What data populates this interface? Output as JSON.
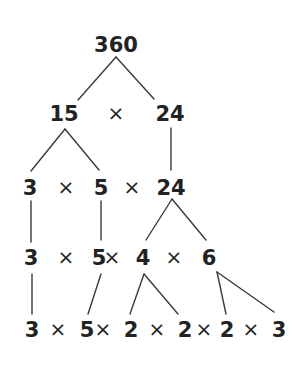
{
  "diagram": {
    "root": "360",
    "text_color": "#222222",
    "line_color": "#3a3a3a",
    "rows": [
      {
        "tokens": [
          {
            "text": "360",
            "type": "number",
            "x": 116,
            "y": 52
          }
        ]
      },
      {
        "tokens": [
          {
            "text": "15",
            "type": "number",
            "x": 64,
            "y": 121
          },
          {
            "text": "×",
            "type": "operator",
            "x": 116,
            "y": 120
          },
          {
            "text": "24",
            "type": "number",
            "x": 170,
            "y": 121
          }
        ]
      },
      {
        "tokens": [
          {
            "text": "3",
            "type": "number",
            "x": 30,
            "y": 195
          },
          {
            "text": "×",
            "type": "operator",
            "x": 66,
            "y": 194
          },
          {
            "text": "5",
            "type": "number",
            "x": 101,
            "y": 195
          },
          {
            "text": "×",
            "type": "operator",
            "x": 132,
            "y": 194
          },
          {
            "text": "24",
            "type": "number",
            "x": 171,
            "y": 195
          }
        ]
      },
      {
        "tokens": [
          {
            "text": "3",
            "type": "number",
            "x": 31,
            "y": 265
          },
          {
            "text": "×",
            "type": "operator",
            "x": 66,
            "y": 264
          },
          {
            "text": "5",
            "type": "number",
            "x": 99,
            "y": 265
          },
          {
            "text": "×",
            "type": "operator",
            "x": 112,
            "y": 264
          },
          {
            "text": "4",
            "type": "number",
            "x": 143,
            "y": 265
          },
          {
            "text": "×",
            "type": "operator",
            "x": 174,
            "y": 264
          },
          {
            "text": "6",
            "type": "number",
            "x": 209,
            "y": 265
          }
        ]
      },
      {
        "tokens": [
          {
            "text": "3",
            "type": "number",
            "x": 32,
            "y": 337
          },
          {
            "text": "×",
            "type": "operator",
            "x": 58,
            "y": 336
          },
          {
            "text": "5",
            "type": "number",
            "x": 87,
            "y": 337
          },
          {
            "text": "×",
            "type": "operator",
            "x": 103,
            "y": 336
          },
          {
            "text": "2",
            "type": "number",
            "x": 131,
            "y": 337
          },
          {
            "text": "×",
            "type": "operator",
            "x": 157,
            "y": 336
          },
          {
            "text": "2",
            "type": "number",
            "x": 185,
            "y": 337
          },
          {
            "text": "×",
            "type": "operator",
            "x": 204,
            "y": 336
          },
          {
            "text": "2",
            "type": "number",
            "x": 227,
            "y": 337
          },
          {
            "text": "×",
            "type": "operator",
            "x": 251,
            "y": 336
          },
          {
            "text": "3",
            "type": "number",
            "x": 279,
            "y": 337
          }
        ]
      }
    ],
    "edges": [
      {
        "from": "360",
        "to": "15",
        "x1": 116,
        "y1": 57,
        "x2": 78,
        "y2": 100
      },
      {
        "from": "360",
        "to": "24",
        "x1": 116,
        "y1": 57,
        "x2": 154,
        "y2": 99
      },
      {
        "from": "15",
        "to": "3",
        "x1": 65,
        "y1": 129,
        "x2": 31,
        "y2": 171
      },
      {
        "from": "15",
        "to": "5",
        "x1": 65,
        "y1": 129,
        "x2": 99,
        "y2": 170
      },
      {
        "from": "24",
        "to": "24",
        "x1": 171,
        "y1": 128,
        "x2": 171,
        "y2": 170
      },
      {
        "from": "3",
        "to": "3",
        "x1": 31,
        "y1": 201,
        "x2": 31,
        "y2": 242
      },
      {
        "from": "5",
        "to": "5",
        "x1": 101,
        "y1": 201,
        "x2": 101,
        "y2": 240
      },
      {
        "from": "24",
        "to": "4",
        "x1": 172,
        "y1": 199,
        "x2": 146,
        "y2": 240
      },
      {
        "from": "24",
        "to": "6",
        "x1": 172,
        "y1": 199,
        "x2": 206,
        "y2": 240
      },
      {
        "from": "3",
        "to": "3",
        "x1": 32,
        "y1": 274,
        "x2": 32,
        "y2": 314
      },
      {
        "from": "5",
        "to": "5",
        "x1": 101,
        "y1": 274,
        "x2": 88,
        "y2": 314
      },
      {
        "from": "4",
        "to": "2",
        "x1": 144,
        "y1": 274,
        "x2": 130,
        "y2": 314
      },
      {
        "from": "4",
        "to": "2",
        "x1": 144,
        "y1": 274,
        "x2": 178,
        "y2": 314
      },
      {
        "from": "6",
        "to": "2",
        "x1": 217,
        "y1": 272,
        "x2": 226,
        "y2": 314
      },
      {
        "from": "6",
        "to": "3",
        "x1": 217,
        "y1": 272,
        "x2": 274,
        "y2": 312
      }
    ],
    "final_factorization": "3 × 5 × 2 × 2 × 2 × 3"
  }
}
